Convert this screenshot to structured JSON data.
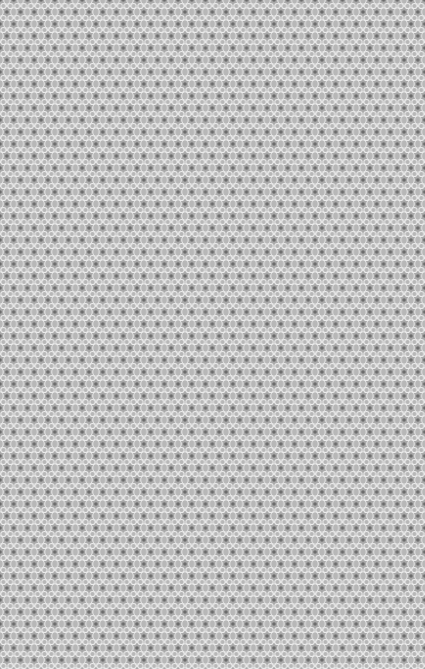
{
  "texture": {
    "name": "gray-star-lattice-pattern",
    "colors": {
      "background": "#a9a9a9",
      "petal": "#b7b7b7",
      "outline": "#ececec",
      "star_center": "#6c6c6c"
    },
    "tile_width": 13.7,
    "tile_height": 24
  }
}
